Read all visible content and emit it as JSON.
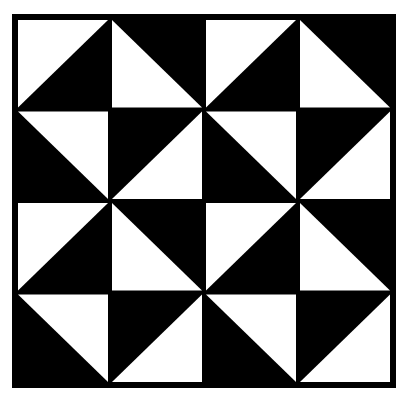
{
  "colors": {
    "background": "#ffffff",
    "dark": "#000000",
    "light": "#ffffff"
  },
  "grid": {
    "rows": 4,
    "cols": 4,
    "frame": {
      "x": 12,
      "y": 14,
      "width": 384,
      "height": 374
    },
    "cells": [
      [
        "TL",
        "BL",
        "TL",
        "BL"
      ],
      [
        "TR",
        "BR",
        "TR",
        "BR"
      ],
      [
        "TL",
        "BL",
        "TL",
        "BL"
      ],
      [
        "TR",
        "BR",
        "TR",
        "BR"
      ]
    ]
  }
}
